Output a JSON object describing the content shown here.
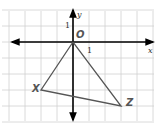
{
  "diagram": {
    "type": "coordinate-plane-triangle",
    "grid": {
      "x_min": -4,
      "x_max": 5,
      "y_min": -5,
      "y_max": 2,
      "spacing_px": 16,
      "color": "#d0d0d0"
    },
    "axes": {
      "x_label": "x",
      "y_label": "y",
      "color": "#000000"
    },
    "ticks": {
      "x_one": "1",
      "y_one": "1"
    },
    "points": [
      {
        "name": "O",
        "label": "O",
        "x": 0,
        "y": 0
      },
      {
        "name": "X",
        "label": "X",
        "x": -2,
        "y": -3
      },
      {
        "name": "Z",
        "label": "Z",
        "x": 3,
        "y": -4
      }
    ],
    "triangle": [
      "O",
      "X",
      "Z"
    ],
    "line_color": "#555555",
    "label_color": "#555555"
  }
}
